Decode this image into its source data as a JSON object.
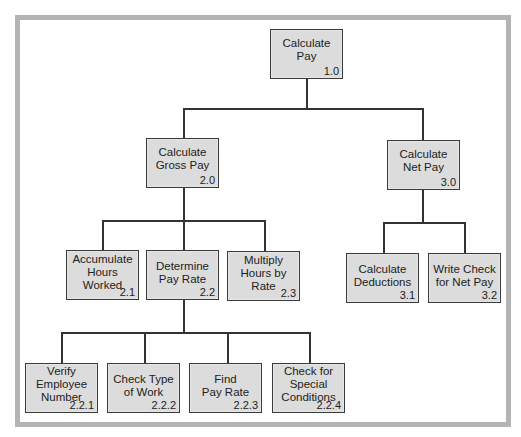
{
  "diagram": {
    "type": "hierarchy-chart",
    "frame_color": "#b4b4b4",
    "box_fill": "#dcdcdc",
    "line_color": "#333333",
    "nodes": {
      "n1_0": {
        "label": "Calculate\nPay",
        "number": "1.0"
      },
      "n2_0": {
        "label": "Calculate\nGross Pay",
        "number": "2.0"
      },
      "n3_0": {
        "label": "Calculate\nNet Pay",
        "number": "3.0"
      },
      "n2_1": {
        "label": "Accumulate\nHours\nWorked",
        "number": "2.1"
      },
      "n2_2": {
        "label": "Determine\nPay Rate",
        "number": "2.2"
      },
      "n2_3": {
        "label": "Multiply\nHours by\nRate",
        "number": "2.3"
      },
      "n3_1": {
        "label": "Calculate\nDeductions",
        "number": "3.1"
      },
      "n3_2": {
        "label": "Write Check\nfor Net Pay",
        "number": "3.2"
      },
      "n2_2_1": {
        "label": "Verify\nEmployee\nNumber",
        "number": "2.2.1"
      },
      "n2_2_2": {
        "label": "Check Type\nof Work",
        "number": "2.2.2"
      },
      "n2_2_3": {
        "label": "Find\nPay Rate",
        "number": "2.2.3"
      },
      "n2_2_4": {
        "label": "Check for\nSpecial\nConditions",
        "number": "2.2.4"
      }
    },
    "edges": [
      [
        "1.0",
        "2.0"
      ],
      [
        "1.0",
        "3.0"
      ],
      [
        "2.0",
        "2.1"
      ],
      [
        "2.0",
        "2.2"
      ],
      [
        "2.0",
        "2.3"
      ],
      [
        "3.0",
        "3.1"
      ],
      [
        "3.0",
        "3.2"
      ],
      [
        "2.2",
        "2.2.1"
      ],
      [
        "2.2",
        "2.2.2"
      ],
      [
        "2.2",
        "2.2.3"
      ],
      [
        "2.2",
        "2.2.4"
      ]
    ]
  }
}
